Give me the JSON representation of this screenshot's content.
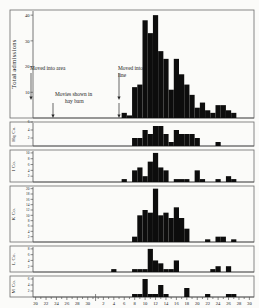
{
  "figure": {
    "month_labels": [
      {
        "text": "March",
        "x": 63
      },
      {
        "text": "April",
        "x": 182
      }
    ]
  },
  "chart_data": {
    "type": "bar",
    "title": "",
    "xlabel": "",
    "ylabel": "Total admissions",
    "grid": false,
    "legend": "none",
    "x_axis": {
      "label_march": "March",
      "label_april": "April",
      "march_ticks": [
        20,
        21,
        22,
        23,
        24,
        25,
        26,
        27,
        28,
        29,
        30,
        31
      ],
      "march_labeled": [
        20,
        22,
        24,
        26,
        28,
        30
      ],
      "april_ticks": [
        1,
        2,
        3,
        4,
        5,
        6,
        7,
        8,
        9,
        10,
        11,
        12,
        13,
        14,
        15,
        16,
        17,
        18,
        19,
        20,
        21,
        22,
        23,
        24,
        25,
        26,
        27,
        28,
        29,
        30
      ],
      "april_labeled": [
        2,
        4,
        6,
        8,
        10,
        12,
        14,
        16,
        18,
        20,
        22,
        24,
        26,
        28,
        30
      ]
    },
    "panels": [
      {
        "name": "total-admissions",
        "ylabel": "Total admissions",
        "ymax": 42,
        "yticks": [
          10,
          20,
          30,
          40
        ],
        "categories": [
          "M20",
          "M21",
          "M22",
          "M23",
          "M24",
          "M25",
          "M26",
          "M27",
          "M28",
          "M29",
          "M30",
          "M31",
          "A1",
          "A2",
          "A3",
          "A4",
          "A5",
          "A6",
          "A7",
          "A8",
          "A9",
          "A10",
          "A11",
          "A12",
          "A13",
          "A14",
          "A15",
          "A16",
          "A17",
          "A18",
          "A19",
          "A20",
          "A21",
          "A22",
          "A23",
          "A24",
          "A25",
          "A26",
          "A27",
          "A28",
          "A29",
          "A30"
        ],
        "values": [
          0,
          0,
          0,
          0,
          0,
          0,
          0,
          0,
          0,
          0,
          0,
          0,
          0,
          0,
          0,
          0,
          0,
          2,
          1,
          12,
          13,
          38,
          33,
          40,
          26,
          23,
          11,
          23,
          17,
          13,
          9,
          4,
          6,
          3,
          2,
          5,
          5,
          3,
          2,
          0,
          0,
          0
        ]
      },
      {
        "name": "hq-company",
        "ylabel": "Hq Co.",
        "ymax": 6,
        "yticks": [
          2,
          4,
          6
        ],
        "categories": [
          "M20",
          "M21",
          "M22",
          "M23",
          "M24",
          "M25",
          "M26",
          "M27",
          "M28",
          "M29",
          "M30",
          "M31",
          "A1",
          "A2",
          "A3",
          "A4",
          "A5",
          "A6",
          "A7",
          "A8",
          "A9",
          "A10",
          "A11",
          "A12",
          "A13",
          "A14",
          "A15",
          "A16",
          "A17",
          "A18",
          "A19",
          "A20",
          "A21",
          "A22",
          "A23",
          "A24",
          "A25",
          "A26",
          "A27",
          "A28",
          "A29",
          "A30"
        ],
        "values": [
          0,
          0,
          0,
          0,
          0,
          0,
          0,
          0,
          0,
          0,
          0,
          0,
          0,
          0,
          0,
          0,
          0,
          0,
          0,
          2,
          2,
          4,
          3,
          5,
          5,
          3,
          1,
          4,
          3,
          3,
          3,
          2,
          0,
          0,
          0,
          1,
          0,
          0,
          0,
          0,
          0,
          0
        ]
      },
      {
        "name": "i-company",
        "ylabel": "I Co.",
        "ymax": 11,
        "yticks": [
          2,
          4,
          6,
          8,
          10
        ],
        "categories": [
          "M20",
          "M21",
          "M22",
          "M23",
          "M24",
          "M25",
          "M26",
          "M27",
          "M28",
          "M29",
          "M30",
          "M31",
          "A1",
          "A2",
          "A3",
          "A4",
          "A5",
          "A6",
          "A7",
          "A8",
          "A9",
          "A10",
          "A11",
          "A12",
          "A13",
          "A14",
          "A15",
          "A16",
          "A17",
          "A18",
          "A19",
          "A20",
          "A21",
          "A22",
          "A23",
          "A24",
          "A25",
          "A26",
          "A27",
          "A28",
          "A29",
          "A30"
        ],
        "values": [
          0,
          0,
          0,
          0,
          0,
          0,
          0,
          0,
          0,
          0,
          0,
          0,
          0,
          0,
          0,
          0,
          0,
          1,
          0,
          4,
          5,
          2,
          7,
          10,
          5,
          4,
          0,
          1,
          1,
          1,
          0,
          4,
          1,
          0,
          0,
          1,
          0,
          2,
          1,
          0,
          0,
          0
        ]
      },
      {
        "name": "k-company",
        "ylabel": "K Co.",
        "ymax": 21,
        "yticks": [
          2,
          4,
          6,
          8,
          10,
          12,
          14,
          16,
          18,
          20
        ],
        "categories": [
          "M20",
          "M21",
          "M22",
          "M23",
          "M24",
          "M25",
          "M26",
          "M27",
          "M28",
          "M29",
          "M30",
          "M31",
          "A1",
          "A2",
          "A3",
          "A4",
          "A5",
          "A6",
          "A7",
          "A8",
          "A9",
          "A10",
          "A11",
          "A12",
          "A13",
          "A14",
          "A15",
          "A16",
          "A17",
          "A18",
          "A19",
          "A20",
          "A21",
          "A22",
          "A23",
          "A24",
          "A25",
          "A26",
          "A27",
          "A28",
          "A29",
          "A30"
        ],
        "values": [
          0,
          0,
          0,
          0,
          0,
          0,
          0,
          0,
          0,
          0,
          0,
          0,
          0,
          0,
          0,
          0,
          0,
          0,
          0,
          2,
          10,
          12,
          11,
          20,
          10,
          11,
          9,
          13,
          9,
          5,
          0,
          0,
          0,
          1,
          0,
          2,
          2,
          0,
          1,
          0,
          0,
          0
        ]
      },
      {
        "name": "l-company",
        "ylabel": "L Co.",
        "ymax": 9,
        "yticks": [
          2,
          4,
          6,
          8
        ],
        "categories": [
          "M20",
          "M21",
          "M22",
          "M23",
          "M24",
          "M25",
          "M26",
          "M27",
          "M28",
          "M29",
          "M30",
          "M31",
          "A1",
          "A2",
          "A3",
          "A4",
          "A5",
          "A6",
          "A7",
          "A8",
          "A9",
          "A10",
          "A11",
          "A12",
          "A13",
          "A14",
          "A15",
          "A16",
          "A17",
          "A18",
          "A19",
          "A20",
          "A21",
          "A22",
          "A23",
          "A24",
          "A25",
          "A26",
          "A27",
          "A28",
          "A29",
          "A30"
        ],
        "values": [
          0,
          0,
          0,
          0,
          0,
          0,
          0,
          0,
          0,
          0,
          0,
          0,
          0,
          0,
          0,
          1,
          0,
          0,
          0,
          1,
          1,
          1,
          8,
          4,
          3,
          1,
          1,
          4,
          0,
          0,
          0,
          0,
          0,
          0,
          1,
          2,
          0,
          2,
          0,
          0,
          0,
          0
        ]
      },
      {
        "name": "m-company",
        "ylabel": "M Co.",
        "ymax": 7,
        "yticks": [
          2,
          4,
          6
        ],
        "categories": [
          "M20",
          "M21",
          "M22",
          "M23",
          "M24",
          "M25",
          "M26",
          "M27",
          "M28",
          "M29",
          "M30",
          "M31",
          "A1",
          "A2",
          "A3",
          "A4",
          "A5",
          "A6",
          "A7",
          "A8",
          "A9",
          "A10",
          "A11",
          "A12",
          "A13",
          "A14",
          "A15",
          "A16",
          "A17",
          "A18",
          "A19",
          "A20",
          "A21",
          "A22",
          "A23",
          "A24",
          "A25",
          "A26",
          "A27",
          "A28",
          "A29",
          "A30"
        ],
        "values": [
          0,
          0,
          0,
          0,
          0,
          0,
          0,
          0,
          0,
          0,
          0,
          0,
          0,
          0,
          0,
          0,
          0,
          0,
          0,
          1,
          1,
          6,
          1,
          1,
          4,
          1,
          0,
          0,
          0,
          3,
          0,
          0,
          0,
          1,
          0,
          0,
          0,
          1,
          1,
          0,
          0,
          0
        ]
      }
    ],
    "annotations": [
      {
        "name": "moved-into-area",
        "text": "Moved into area",
        "text_x": 30,
        "text_y": 70,
        "arrow_x": 31,
        "arrow_y1": 73,
        "arrow_y2": 100
      },
      {
        "name": "moved-into-line",
        "text_line1": "Moved into",
        "text_line2": "line",
        "text_x": 118,
        "text_y": 70,
        "arrow_x": 119,
        "arrow_y1": 73,
        "arrow_y2": 100
      },
      {
        "name": "movies-shown-in-hay-barn",
        "text_line1": "Movies shown in",
        "text_line2": "hay barn",
        "text_x": 55,
        "text_y": 96,
        "arrow_x1": 53,
        "arrow_x2": 119,
        "arrow_y1": 103,
        "arrow_y2": 118
      }
    ]
  }
}
